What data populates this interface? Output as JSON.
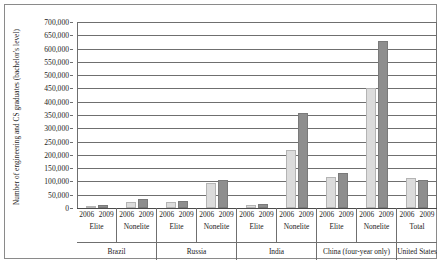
{
  "chart_data": {
    "type": "bar",
    "title": "",
    "xlabel": "",
    "ylabel": "Number of engineering and CS graduates (bachelor's level)",
    "ylim": [
      0,
      700000
    ],
    "ytick_labels": [
      "700,000",
      "650,000",
      "600,000",
      "550,000",
      "500,000",
      "450,000",
      "400,000",
      "350,000",
      "300,000",
      "250,000",
      "200,000",
      "150,000",
      "100,000",
      "50,000",
      "0"
    ],
    "ytick_values": [
      700000,
      650000,
      600000,
      550000,
      500000,
      450000,
      400000,
      350000,
      300000,
      250000,
      200000,
      150000,
      100000,
      50000,
      0
    ],
    "grid": true,
    "legend_position": "none",
    "categories": [
      "Brazil Elite",
      "Brazil Nonelite",
      "Russia Elite",
      "Russia Nonelite",
      "India Elite",
      "India Nonelite",
      "China Elite",
      "China Nonelite",
      "United States Total"
    ],
    "series": [
      {
        "name": "2006",
        "color": "#dcdcdc",
        "values": [
          6000,
          22000,
          21000,
          96000,
          10000,
          220000,
          118000,
          450000,
          113000
        ]
      },
      {
        "name": "2009",
        "color": "#8e8e8e",
        "values": [
          12000,
          35000,
          25000,
          105000,
          15000,
          356000,
          130000,
          628000,
          107000
        ]
      }
    ],
    "x_axis_groups": [
      {
        "country": "Brazil",
        "subgroups": [
          {
            "label": "Elite",
            "years": [
              "2006",
              "2009"
            ]
          },
          {
            "label": "Nonelite",
            "years": [
              "2006",
              "2009"
            ]
          }
        ]
      },
      {
        "country": "Russia",
        "subgroups": [
          {
            "label": "Elite",
            "years": [
              "2006",
              "2009"
            ]
          },
          {
            "label": "Nonelite",
            "years": [
              "2006",
              "2009"
            ]
          }
        ]
      },
      {
        "country": "India",
        "subgroups": [
          {
            "label": "Elite",
            "years": [
              "2006",
              "2009"
            ]
          },
          {
            "label": "Nonelite",
            "years": [
              "2006",
              "2009"
            ]
          }
        ]
      },
      {
        "country": "China (four-year only)",
        "subgroups": [
          {
            "label": "Elite",
            "years": [
              "2006",
              "2009"
            ]
          },
          {
            "label": "Nonelite",
            "years": [
              "2006",
              "2009"
            ]
          }
        ]
      },
      {
        "country": "United States",
        "subgroups": [
          {
            "label": "Total",
            "years": [
              "2006",
              "2009"
            ]
          }
        ]
      }
    ]
  }
}
